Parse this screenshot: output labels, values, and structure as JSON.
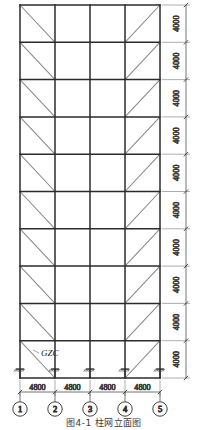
{
  "drawing": {
    "title_caption": "图4-1 柱网立面图",
    "member_label": "GZC",
    "span_label": "4800",
    "story_label": "4000",
    "bays": 4,
    "stories": 10,
    "span_labels": [
      "4800",
      "4800",
      "4800",
      "4800"
    ],
    "story_labels": [
      "4000",
      "4000",
      "4000",
      "4000",
      "4000",
      "4000",
      "4000",
      "4000",
      "4000",
      "4000"
    ],
    "grid_bubbles": [
      "1",
      "2",
      "3",
      "4",
      "5"
    ],
    "brace_bays": [
      {
        "bay": 1,
        "direction": "top-left-to-bottom-right"
      },
      {
        "bay": 4,
        "direction": "bottom-left-to-top-right"
      }
    ],
    "support_count": 5,
    "support_type": "fixed-hatched",
    "colors": {
      "member": "#2b2b2b",
      "brace": "#8a8a8a",
      "dimension": "#3a3a3a",
      "background": "#ffffff"
    }
  }
}
